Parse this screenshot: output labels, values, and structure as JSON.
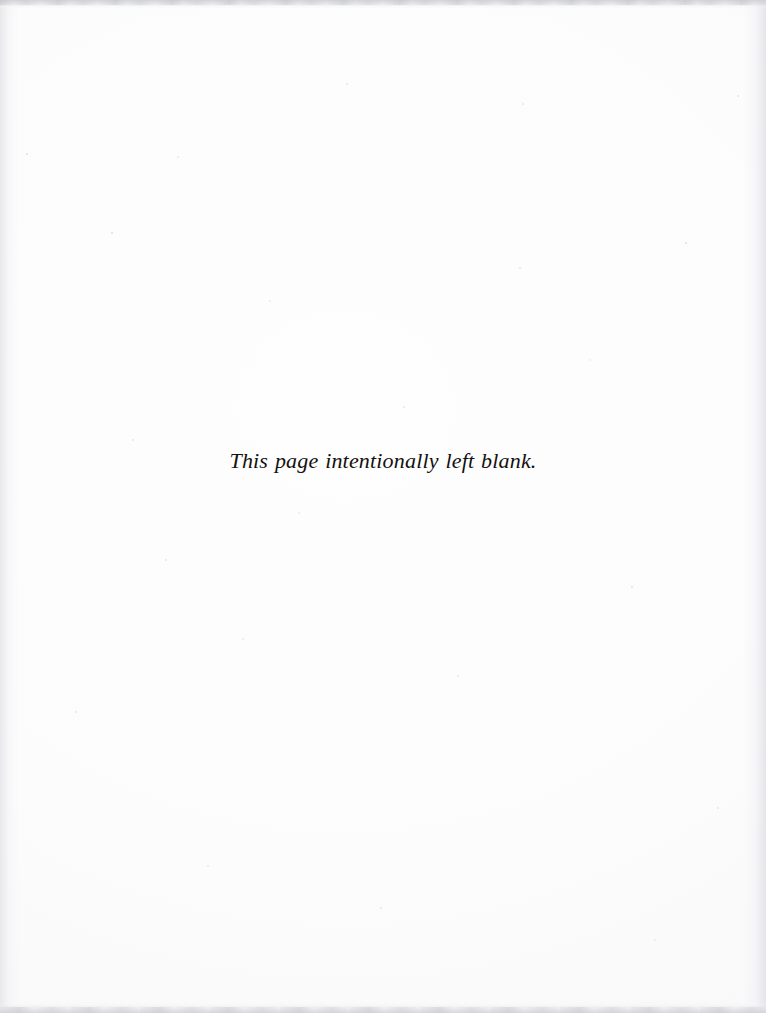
{
  "page": {
    "kind": "scanned-book-page",
    "width": 766,
    "height": 1013,
    "background_color": "#fefefe",
    "text_color": "#14110f",
    "edge_band_color": "#cecfd3",
    "edge_shade_color": "#e2e2e6"
  },
  "notice": {
    "text": "This page intentionally left blank."
  }
}
